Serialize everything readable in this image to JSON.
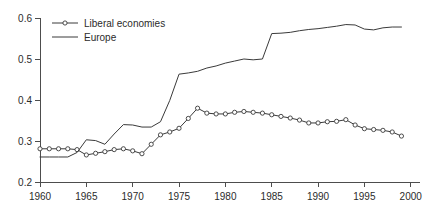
{
  "chart_data": {
    "type": "line",
    "title": "",
    "subtitle": "",
    "xlabel": "",
    "ylabel": "",
    "xlim": [
      1960,
      2001
    ],
    "ylim": [
      0.2,
      0.6
    ],
    "grid": false,
    "legend_position": "top-left",
    "x_ticks": [
      1960,
      1965,
      1970,
      1975,
      1980,
      1985,
      1990,
      1995,
      2000
    ],
    "x_tick_labels": [
      "1960",
      "1965",
      "1970",
      "1975",
      "1980",
      "1985",
      "1990",
      "1995",
      "2000"
    ],
    "y_ticks": [
      0.2,
      0.3,
      0.4,
      0.5,
      0.6
    ],
    "y_tick_labels": [
      "0.2",
      "0.3",
      "0.4",
      "0.5",
      "0.6"
    ],
    "x": [
      1960,
      1961,
      1962,
      1963,
      1964,
      1965,
      1966,
      1967,
      1968,
      1969,
      1970,
      1971,
      1972,
      1973,
      1974,
      1975,
      1976,
      1977,
      1978,
      1979,
      1980,
      1981,
      1982,
      1983,
      1984,
      1985,
      1986,
      1987,
      1988,
      1989,
      1990,
      1991,
      1992,
      1993,
      1994,
      1995,
      1996,
      1997,
      1998,
      1999
    ],
    "series": [
      {
        "name": "Liberal economies",
        "marker": "circle",
        "color": "#3a3a3a",
        "values": [
          0.281,
          0.281,
          0.281,
          0.281,
          0.279,
          0.266,
          0.27,
          0.274,
          0.279,
          0.281,
          0.276,
          0.269,
          0.292,
          0.315,
          0.322,
          0.331,
          0.355,
          0.38,
          0.368,
          0.366,
          0.366,
          0.37,
          0.372,
          0.37,
          0.368,
          0.364,
          0.36,
          0.356,
          0.351,
          0.344,
          0.344,
          0.347,
          0.348,
          0.352,
          0.339,
          0.33,
          0.328,
          0.326,
          0.322,
          0.312
        ]
      },
      {
        "name": "Europe",
        "marker": "none",
        "color": "#3a3a3a",
        "values": [
          0.261,
          0.261,
          0.261,
          0.261,
          0.272,
          0.303,
          0.301,
          0.292,
          0.317,
          0.34,
          0.339,
          0.334,
          0.334,
          0.347,
          0.399,
          0.463,
          0.466,
          0.47,
          0.478,
          0.483,
          0.49,
          0.495,
          0.5,
          0.498,
          0.5,
          0.562,
          0.563,
          0.565,
          0.569,
          0.572,
          0.574,
          0.577,
          0.58,
          0.584,
          0.583,
          0.573,
          0.571,
          0.576,
          0.578,
          0.578
        ]
      }
    ]
  },
  "legend": {
    "entries": [
      {
        "label": "Liberal economies",
        "marker": "circle"
      },
      {
        "label": "Europe",
        "marker": "none"
      }
    ]
  },
  "colors": {
    "axis": "#4d4d4d",
    "text": "#2b2b2b",
    "line": "#3a3a3a",
    "marker_fill": "#ffffff",
    "background": "#ffffff"
  }
}
